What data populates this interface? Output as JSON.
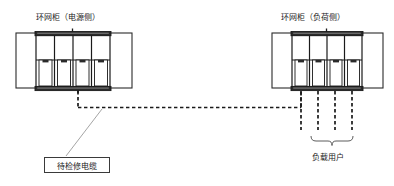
{
  "diagram": {
    "type": "ring-main-unit-cable-maintenance-schematic",
    "background_color": "#ffffff",
    "stroke_color": "#1a1a1a",
    "leader_color": "#9a9a9a",
    "dash_color": "#1a1a1a",
    "titles": {
      "left_cabinet": "环网柜（电源侧）",
      "right_cabinet": "环网柜（负荷侧）"
    },
    "labels": {
      "cable_under_maintenance": "待检修电缆",
      "load_users": "负载用户"
    },
    "left_cabinet": {
      "name": "环网柜（电源侧）",
      "compartments": 4,
      "doors": 2,
      "has_top_stub": true,
      "has_bottom_stub": true
    },
    "right_cabinet": {
      "name": "环网柜（负荷侧）",
      "compartments": 4,
      "doors": 2,
      "has_top_stub": true,
      "feeder_drops": 4
    },
    "cable_run": {
      "style": "dashed",
      "from": "left_cabinet_bottom",
      "to": "right_cabinet_bottom_first_feeder"
    },
    "brace": {
      "spans_feeders": 3,
      "label": "负载用户"
    }
  }
}
